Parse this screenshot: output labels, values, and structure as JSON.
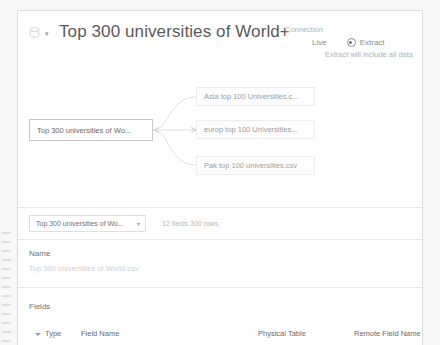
{
  "header": {
    "title": "Top 300 universities of World+",
    "db_icon": "database-icon",
    "caret_icon": "chevron-down-icon"
  },
  "connection": {
    "label": "Connection",
    "live_label": "Live",
    "extract_label": "Extract",
    "selected": "Extract",
    "note": "Extract will include all data"
  },
  "diagram": {
    "main_node": "Top 300 universities of Wo...",
    "children": [
      {
        "label": "Asia top 100 Universities.c..."
      },
      {
        "label": "europ top 100 Universities..."
      },
      {
        "label": "Pak top 100 universities.csv"
      }
    ]
  },
  "table_select": {
    "value": "Top 300 universities of Wo...",
    "caret_icon": "chevron-down-icon",
    "meta": "12 fields 300 rows"
  },
  "name_section": {
    "label": "Name",
    "value": "Top 300 universities of World.csv"
  },
  "fields_section": {
    "label": "Fields",
    "columns": [
      "Type",
      "Field Name",
      "Physical Table",
      "Remote Field Name"
    ]
  },
  "colors": {
    "accent": "#6d6d6d",
    "border": "#dcdcdc",
    "muted_text": "#b0b0b0"
  }
}
